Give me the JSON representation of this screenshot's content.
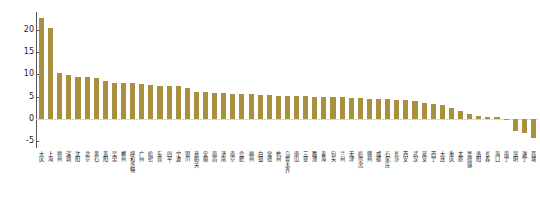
{
  "chart_data": {
    "type": "bar",
    "title": "",
    "subtitle": "",
    "xlabel": "",
    "ylabel": "单位GDP二氧化碳排放降低（%）",
    "ylim": [
      -6.5,
      24
    ],
    "yticks": [
      20,
      15,
      10,
      5,
      0,
      -5
    ],
    "ytick_labels": [
      "20",
      "15",
      "10",
      "5",
      "0",
      "-5"
    ],
    "grid": false,
    "legend": "none",
    "bar_color": "#a8903e",
    "axis_color": "#555555",
    "baseline_color": "#d8d8d8",
    "categories": [
      "大庆",
      "上海",
      "徐州",
      "深圳",
      "沈阳",
      "北京",
      "黄石",
      "贵阳",
      "吴忠",
      "郴州",
      "呼和浩特",
      "广州",
      "哈密",
      "东营",
      "四平",
      "宁波",
      "银川",
      "嘉峪关",
      "安顺",
      "南昌",
      "济南",
      "南京",
      "合肥",
      "柳州",
      "白银",
      "常德",
      "杭州",
      "乌鲁木齐",
      "唐山",
      "三亚",
      "鹰潭",
      "青海",
      "包头",
      "兰州",
      "天津",
      "哈尔滨",
      "赣州",
      "成都",
      "石家庄",
      "长沙",
      "西安",
      "武汉",
      "延安",
      "西宁",
      "大连",
      "重庆",
      "太原",
      "景德镇",
      "洛阳",
      "长春",
      "海口",
      "南宁",
      "昆明",
      "遂宁",
      "晋城"
    ],
    "values": [
      22.6,
      20.3,
      10.3,
      9.9,
      9.4,
      9.4,
      9.3,
      8.6,
      8.1,
      8.1,
      8.0,
      7.8,
      7.6,
      7.5,
      7.4,
      7.3,
      6.9,
      6.0,
      6.0,
      5.9,
      5.9,
      5.7,
      5.6,
      5.5,
      5.4,
      5.3,
      5.2,
      5.2,
      5.1,
      5.1,
      5.0,
      5.0,
      4.9,
      4.9,
      4.8,
      4.7,
      4.6,
      4.5,
      4.4,
      4.3,
      4.2,
      4.0,
      3.7,
      3.4,
      3.1,
      2.5,
      1.9,
      1.2,
      0.7,
      0.5,
      0.4,
      -0.2,
      -2.6,
      -3.2,
      -4.3
    ]
  }
}
